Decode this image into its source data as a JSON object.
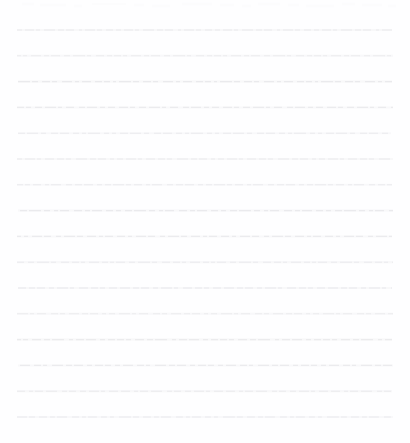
{
  "document": {
    "kind": "scanned-ruled-paper",
    "title": "Blank ruled notebook paper (faded scan)",
    "description": "A scanned sheet of lined paper with no written content.",
    "width": 410,
    "height": 443,
    "background_color": "#fefeff",
    "page_color": "#ffffff"
  },
  "ruling": {
    "line_count": 16,
    "first_line_y": 30,
    "line_spacing": 25.8,
    "left_margin_x": 17,
    "right_margin_x": 393,
    "line_color": "#e9e9ec",
    "line_color_light": "#f2f2f4",
    "stroke_width": 1.1,
    "style": "broken-dashed-faded",
    "has_vertical_margin_rule": false,
    "has_holes": false,
    "has_header": false,
    "text_content": ""
  },
  "artifacts": {
    "top_noise_present": true,
    "top_noise_y": 5,
    "top_noise_color": "#fafafb",
    "top_noise_opacity": 0.55,
    "note": "Faint irregular scan speckle along the upper edge."
  },
  "lines": [
    {
      "index": 1,
      "y": 30.0,
      "x1": 17,
      "x2": 392,
      "opacity": 0.92,
      "dash": "5 3 9 2 4 4 11 3 6 2 8 5 3 3 10 2 5 4 7 3",
      "offset": 0
    },
    {
      "index": 2,
      "y": 55.8,
      "x1": 17,
      "x2": 393,
      "opacity": 0.88,
      "dash": "7 2 4 4 10 3 5 2 9 4 6 3 12 2 4 5 8 3 5 2",
      "offset": 3
    },
    {
      "index": 3,
      "y": 81.6,
      "x1": 18,
      "x2": 392,
      "opacity": 0.95,
      "dash": "3 3 12 2 6 4 8 2 5 5 10 3 4 3 9 4 7 2 6 3",
      "offset": 6
    },
    {
      "index": 4,
      "y": 107.4,
      "x1": 17,
      "x2": 393,
      "opacity": 0.9,
      "dash": "9 2 5 4 7 3 11 2 4 4 8 5 6 2 10 3 5 3 7 4",
      "offset": 2
    },
    {
      "index": 5,
      "y": 133.2,
      "x1": 18,
      "x2": 391,
      "opacity": 0.86,
      "dash": "4 4 8 2 11 3 5 5 7 2 9 4 6 3 4 2 12 4 5 3",
      "offset": 9
    },
    {
      "index": 6,
      "y": 159.0,
      "x1": 17,
      "x2": 393,
      "opacity": 0.93,
      "dash": "6 3 10 2 4 4 9 3 7 2 5 5 11 3 6 2 8 4 4 3",
      "offset": 1
    },
    {
      "index": 7,
      "y": 184.8,
      "x1": 17,
      "x2": 392,
      "opacity": 0.89,
      "dash": "11 2 5 3 8 4 4 2 10 5 6 3 7 2 9 4 5 3 6 2",
      "offset": 5
    },
    {
      "index": 8,
      "y": 210.6,
      "x1": 18,
      "x2": 393,
      "opacity": 0.94,
      "dash": "5 4 7 2 12 3 6 4 4 2 9 5 8 3 5 2 10 4 7 3",
      "offset": 7
    },
    {
      "index": 9,
      "y": 236.4,
      "x1": 17,
      "x2": 392,
      "opacity": 0.87,
      "dash": "8 3 4 4 10 2 7 5 5 3 11 2 6 4 9 3 4 2 8 4",
      "offset": 4
    },
    {
      "index": 10,
      "y": 262.2,
      "x1": 17,
      "x2": 393,
      "opacity": 0.91,
      "dash": "4 2 9 4 6 3 12 2 5 5 8 3 7 2 4 4 10 3 6 2",
      "offset": 8
    },
    {
      "index": 11,
      "y": 288.0,
      "x1": 18,
      "x2": 392,
      "opacity": 0.96,
      "dash": "10 3 6 2 8 4 5 3 11 2 4 5 9 3 7 2 5 4 8 3",
      "offset": 2
    },
    {
      "index": 12,
      "y": 313.8,
      "x1": 17,
      "x2": 393,
      "opacity": 0.88,
      "dash": "6 4 11 2 4 3 9 5 7 2 5 4 10 3 6 2 8 4 4 3",
      "offset": 10
    },
    {
      "index": 13,
      "y": 339.6,
      "x1": 17,
      "x2": 392,
      "opacity": 0.93,
      "dash": "7 2 5 4 9 3 6 2 12 5 4 3 8 2 10 4 5 3 7 2",
      "offset": 3
    },
    {
      "index": 14,
      "y": 365.4,
      "x1": 18,
      "x2": 393,
      "opacity": 0.9,
      "dash": "5 3 10 4 7 2 4 5 11 3 6 2 9 4 5 3 8 2 6 4",
      "offset": 6
    },
    {
      "index": 15,
      "y": 391.2,
      "x1": 17,
      "x2": 392,
      "opacity": 0.94,
      "dash": "9 4 4 2 8 3 11 5 5 2 7 4 6 3 10 2 4 4 9 3",
      "offset": 1
    },
    {
      "index": 16,
      "y": 417.0,
      "x1": 17,
      "x2": 393,
      "opacity": 0.85,
      "dash": "4 5 12 2 6 4 8 3 5 2 10 5 7 3 4 2 9 4 6 3",
      "offset": 11
    }
  ]
}
